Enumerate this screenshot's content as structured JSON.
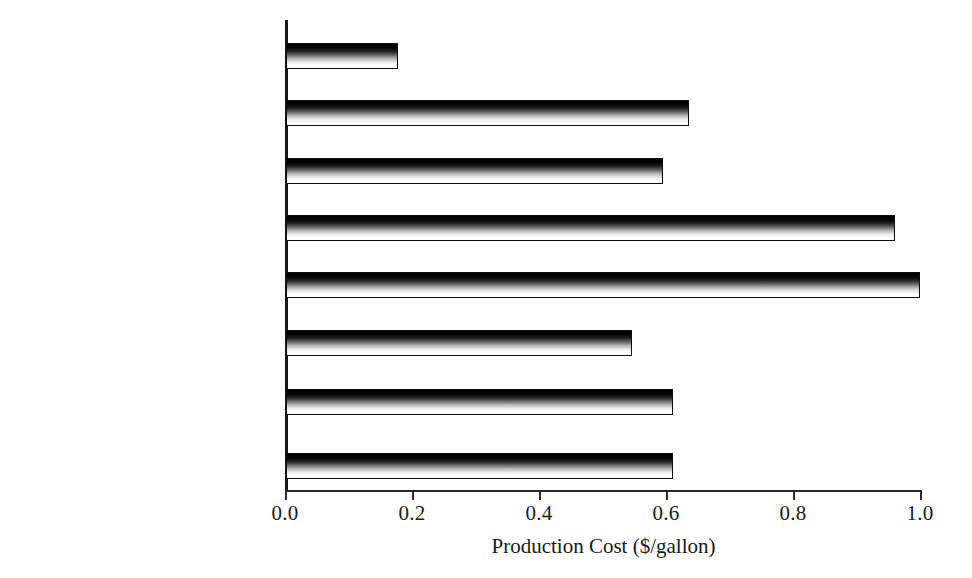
{
  "chart_data": {
    "type": "bar",
    "orientation": "horizontal",
    "title": "",
    "xlabel": "Production Cost ($/gallon)",
    "ylabel": "",
    "xlim": [
      0.0,
      1.0
    ],
    "xticks": [
      "0.0",
      "0.2",
      "0.4",
      "0.6",
      "0.8",
      "1.0"
    ],
    "xtick_values": [
      0.0,
      0.2,
      0.4,
      0.6,
      0.8,
      1.0
    ],
    "grid": false,
    "legend": null,
    "categories": [
      "Ethanol's Value as Fuel",
      "Straw/Lignin/Electricity",
      "Wood/Lignin/Electricity",
      "Straw/Enzymic/Electricity",
      "Wood/Enzymic/Electricity",
      "Straw/Acid/Electricity",
      "Wood/Acid/Electricity",
      "Grain/Enzymic/DDGS"
    ],
    "values": [
      0.178,
      0.637,
      0.595,
      0.961,
      1.0,
      0.546,
      0.611,
      0.611
    ],
    "bars": [
      {
        "label": "Ethanol's Value as Fuel",
        "value": 0.178,
        "top": 43
      },
      {
        "label": "Straw/Lignin/Electricity",
        "value": 0.637,
        "top": 100
      },
      {
        "label": "Wood/Lignin/Electricity",
        "value": 0.595,
        "top": 158
      },
      {
        "label": "Straw/Enzymic/Electricity",
        "value": 0.961,
        "top": 215
      },
      {
        "label": "Wood/Enzymic/Electricity",
        "value": 1.0,
        "top": 272
      },
      {
        "label": "Straw/Acid/Electricity",
        "value": 0.546,
        "top": 330
      },
      {
        "label": "Wood/Acid/Electricity",
        "value": 0.611,
        "top": 389
      },
      {
        "label": "Grain/Enzymic/DDGS",
        "value": 0.611,
        "top": 453
      }
    ],
    "colors": {
      "background": "#ffffff",
      "axis": "#161616",
      "bar_fill_top": "#000000",
      "bar_fill_bottom": "#ffffff",
      "bar_border": "#0d0d0d",
      "text": "#141414"
    }
  }
}
